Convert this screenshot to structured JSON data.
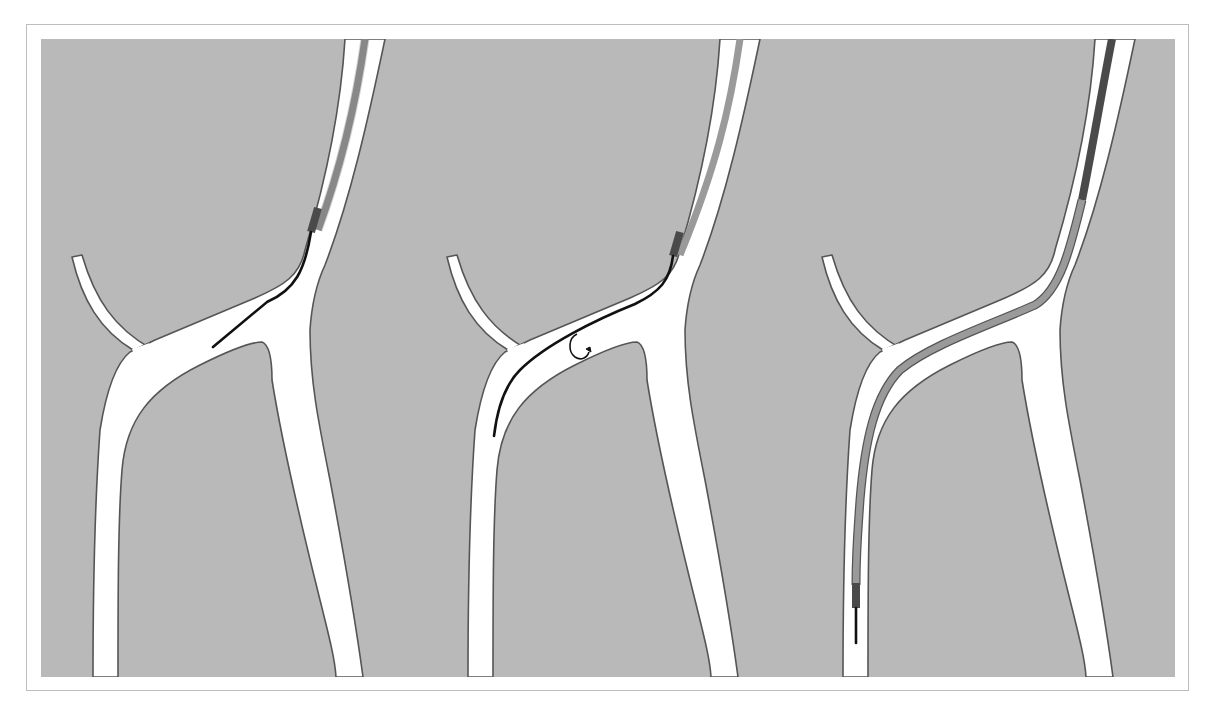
{
  "figure": {
    "colors": {
      "background": "#b9b9b9",
      "vessel_fill": "#ffffff",
      "vessel_outline": "#555555",
      "guidewire": "#111111",
      "catheter": "#9a9a9a",
      "catheter_tip_marker": "#4a4a4a"
    },
    "panels": [
      {
        "step": 1,
        "content": "Guidewire advanced beyond catheter tip into the upper branch toward the bifurcation"
      },
      {
        "step": 2,
        "content": "Guidewire rotated (rotation arrow) and advanced down into the left descending branch"
      },
      {
        "step": 3,
        "content": "Catheter advanced over the guidewire into the left descending branch"
      }
    ],
    "rotation_icon": "rotate-clockwise-arrow"
  },
  "caption": {
    "text": ""
  }
}
